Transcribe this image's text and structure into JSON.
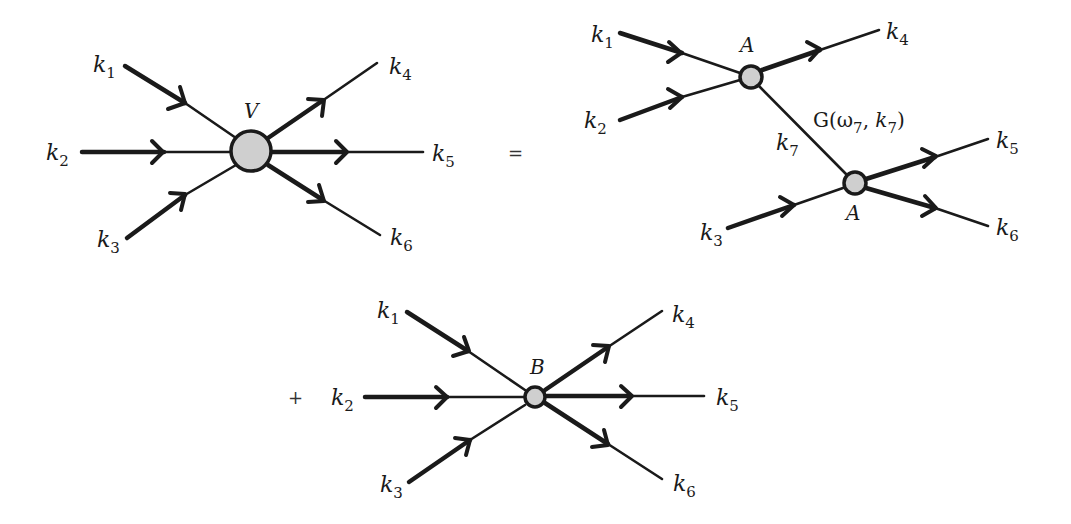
{
  "diagram": {
    "type": "feynman-vertex-expansion",
    "operators": {
      "equals": "=",
      "plus": "+"
    },
    "left": {
      "vertex_label": "V",
      "legs": [
        {
          "name": "k",
          "sub": "1",
          "direction": "in"
        },
        {
          "name": "k",
          "sub": "2",
          "direction": "in"
        },
        {
          "name": "k",
          "sub": "3",
          "direction": "in"
        },
        {
          "name": "k",
          "sub": "4",
          "direction": "out"
        },
        {
          "name": "k",
          "sub": "5",
          "direction": "out"
        },
        {
          "name": "k",
          "sub": "6",
          "direction": "out"
        }
      ]
    },
    "right_top": {
      "vertex_labels": [
        "A",
        "A"
      ],
      "propagator": {
        "label": "G(ω",
        "label_sub": "7",
        "label_mid": ", ",
        "label_k": "k",
        "label_k_sub": "7",
        "label_end": ")",
        "momentum": "k",
        "momentum_sub": "7"
      },
      "legs": [
        {
          "name": "k",
          "sub": "1",
          "direction": "in"
        },
        {
          "name": "k",
          "sub": "2",
          "direction": "in"
        },
        {
          "name": "k",
          "sub": "3",
          "direction": "in"
        },
        {
          "name": "k",
          "sub": "4",
          "direction": "out"
        },
        {
          "name": "k",
          "sub": "5",
          "direction": "out"
        },
        {
          "name": "k",
          "sub": "6",
          "direction": "out"
        }
      ]
    },
    "bottom": {
      "vertex_label": "B",
      "legs": [
        {
          "name": "k",
          "sub": "1",
          "direction": "in"
        },
        {
          "name": "k",
          "sub": "2",
          "direction": "in"
        },
        {
          "name": "k",
          "sub": "3",
          "direction": "in"
        },
        {
          "name": "k",
          "sub": "4",
          "direction": "out"
        },
        {
          "name": "k",
          "sub": "5",
          "direction": "out"
        },
        {
          "name": "k",
          "sub": "6",
          "direction": "out"
        }
      ]
    }
  }
}
